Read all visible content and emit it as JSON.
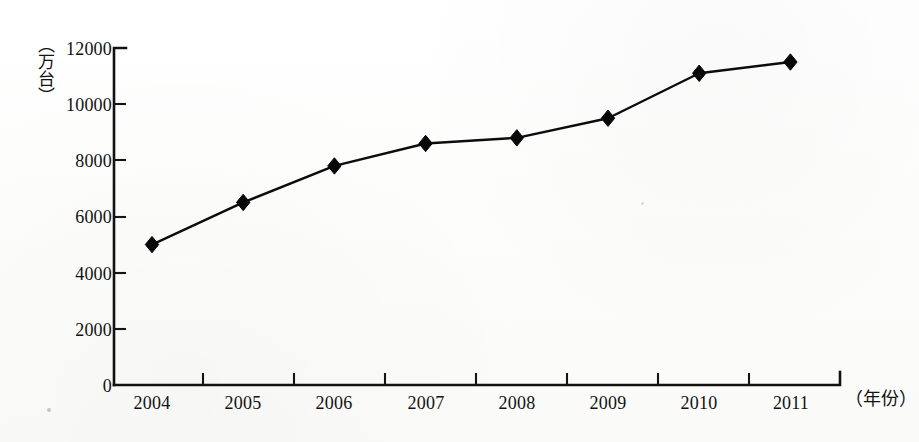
{
  "chart_data": {
    "type": "line",
    "title": "",
    "subtitle": "",
    "xlabel": "（年份）",
    "ylabel": "（万台）",
    "categories": [
      "2004",
      "2005",
      "2006",
      "2007",
      "2008",
      "2009",
      "2010",
      "2011"
    ],
    "values": [
      5000,
      6500,
      7800,
      8600,
      8800,
      9500,
      11100,
      11500
    ],
    "series": [
      {
        "name": "",
        "values": [
          5000,
          6500,
          7800,
          8600,
          8800,
          9500,
          11100,
          11500
        ]
      }
    ],
    "ylim": [
      0,
      12000
    ],
    "ytick_labels": [
      "0",
      "2000",
      "4000",
      "6000",
      "8000",
      "10000",
      "12000"
    ],
    "ytick_values": [
      0,
      2000,
      4000,
      6000,
      8000,
      10000,
      12000
    ],
    "xtick_labels": [
      "2004",
      "2005",
      "2006",
      "2007",
      "2008",
      "2009",
      "2010",
      "2011"
    ],
    "grid": false,
    "legend": false,
    "legend_position": "none",
    "marker": "diamond",
    "line_color": "#0c0c0c",
    "marker_color": "#080808",
    "background_color": "#fdfdfc",
    "annotations": []
  },
  "axes": {
    "y_axis_label": "（万台）",
    "x_axis_label": "（年份）"
  }
}
